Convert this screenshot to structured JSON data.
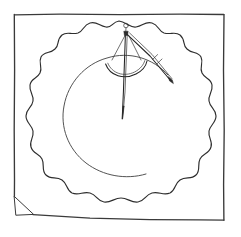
{
  "artwork": {
    "title": "Scalloped Plate with Drawing Compass",
    "medium": "pen and ink line drawing",
    "background_color": "#ffffff",
    "ink_color": "#2b2b2b",
    "canvas": {
      "width": 241,
      "height": 237
    }
  },
  "frame": {
    "name": "hand-drawn square border",
    "stroke_color": "#3a3a3a",
    "left_x": 14,
    "top_y": 14,
    "right_x": 224,
    "bottom_y": 220,
    "corner_fold": {
      "name": "bottom-left triangular fold",
      "points": "14,196 34,214 16,215"
    }
  },
  "plate": {
    "name": "scalloped round plate",
    "center_x": 119,
    "center_y": 117,
    "outer_radius": 99,
    "scallop_count": 22,
    "scallop_depth": 7,
    "edge_stroke_color": "#2e2e2e",
    "well": {
      "name": "inner circular well",
      "center_x": 120,
      "center_y": 114,
      "radius": 58,
      "open_gap_degrees": 55,
      "stroke_color": "#4a4a4a"
    }
  },
  "compass": {
    "name": "drawing compass / divider",
    "hinge_x": 126,
    "hinge_y": 31,
    "knob": {
      "x": 126,
      "y": 26,
      "radius": 2.4
    },
    "needle_leg": {
      "from_x": 126,
      "from_y": 33,
      "to_x": 122,
      "to_y": 119
    },
    "pencil_leg": {
      "from_x": 127,
      "from_y": 33,
      "to_x": 173,
      "to_y": 83
    },
    "arc_bar": {
      "name": "curved adjustment arc",
      "from_x": 106,
      "from_y": 65,
      "to_x": 146,
      "to_y": 62,
      "sag": 14
    },
    "stroke_color": "#232323"
  },
  "a11y": {
    "alt": "Pen and ink drawing of a plate with a scalloped wavy rim inside a square frame, with an open drawing compass resting across its upper portion."
  }
}
